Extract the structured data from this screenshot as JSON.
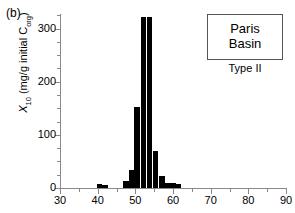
{
  "panel": {
    "label": "(b)"
  },
  "legend": {
    "line1": "Paris",
    "line2": "Basin",
    "sublabel": "Type II"
  },
  "chart_data": {
    "type": "bar",
    "title": "",
    "xlabel": "",
    "ylabel": "X10 (mg/g initial Corg)",
    "ylabel_main": "X",
    "ylabel_sub": "10",
    "ylabel_rest": " (mg/g initial C",
    "ylabel_sub2": "org",
    "ylabel_end": ")",
    "xlim": [
      30,
      90
    ],
    "ylim": [
      0,
      320
    ],
    "grid": false,
    "legend_position": "top-right",
    "x_major_ticks": [
      30,
      40,
      50,
      60,
      70,
      80,
      90
    ],
    "x_minor_ticks": [
      35,
      45,
      55,
      65,
      75,
      85
    ],
    "y_major_ticks": [
      0,
      100,
      200,
      300
    ],
    "y_minor_ticks": [
      25,
      50,
      75,
      125,
      150,
      175,
      225,
      250,
      275,
      325
    ],
    "x_tick_labels": [
      "30",
      "40",
      "50",
      "60",
      "70",
      "80",
      "90"
    ],
    "y_tick_labels": [
      "0",
      "100",
      "200",
      "300"
    ],
    "bar_width": 1.5,
    "bar_color": "#000000",
    "categories": [
      40.5,
      42.0,
      47.5,
      49.0,
      50.5,
      52.0,
      53.5,
      55.0,
      56.5,
      58.0,
      60.0,
      61.5
    ],
    "values": [
      8,
      6,
      14,
      33,
      152,
      322,
      322,
      69,
      23,
      10,
      10,
      7
    ],
    "bars": [
      {
        "x": 40.5,
        "value": 8
      },
      {
        "x": 42.0,
        "value": 6
      },
      {
        "x": 47.5,
        "value": 14
      },
      {
        "x": 49.0,
        "value": 33
      },
      {
        "x": 50.5,
        "value": 152
      },
      {
        "x": 52.2,
        "value": 322
      },
      {
        "x": 53.8,
        "value": 322
      },
      {
        "x": 55.4,
        "value": 69
      },
      {
        "x": 57.0,
        "value": 23
      },
      {
        "x": 58.5,
        "value": 10
      },
      {
        "x": 60.0,
        "value": 10
      },
      {
        "x": 61.5,
        "value": 7
      }
    ]
  }
}
